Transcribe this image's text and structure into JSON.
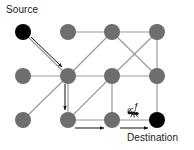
{
  "diagram": {
    "title_labels": {
      "source": "Source",
      "destination": "Destination"
    },
    "type": "grid-graph-ant-colony-routing",
    "colors": {
      "node_normal": "#6e6e6e",
      "node_endpoint": "#000000",
      "edge": "#9a9a9a",
      "arrow": "#111111",
      "background": "#ffffff",
      "text": "#1a1a1a"
    },
    "geometry": {
      "node_radius": 8,
      "columns_x": [
        23,
        68,
        112,
        157
      ],
      "rows_y": [
        32,
        76,
        120
      ]
    },
    "nodes": [
      {
        "id": "n00",
        "name": "source-node",
        "x": 23,
        "y": 32,
        "fill": "#000000",
        "role": "source"
      },
      {
        "id": "n01",
        "name": "grid-node-r0c1",
        "x": 68,
        "y": 32,
        "fill": "#6e6e6e",
        "role": "intermediate"
      },
      {
        "id": "n02",
        "name": "grid-node-r0c2",
        "x": 112,
        "y": 32,
        "fill": "#6e6e6e",
        "role": "intermediate"
      },
      {
        "id": "n03",
        "name": "grid-node-r0c3",
        "x": 157,
        "y": 32,
        "fill": "#6e6e6e",
        "role": "intermediate"
      },
      {
        "id": "n10",
        "name": "grid-node-r1c0",
        "x": 23,
        "y": 76,
        "fill": "#6e6e6e",
        "role": "intermediate"
      },
      {
        "id": "n11",
        "name": "grid-node-r1c1",
        "x": 68,
        "y": 76,
        "fill": "#6e6e6e",
        "role": "intermediate"
      },
      {
        "id": "n12",
        "name": "grid-node-r1c2",
        "x": 112,
        "y": 76,
        "fill": "#6e6e6e",
        "role": "intermediate"
      },
      {
        "id": "n13",
        "name": "grid-node-r1c3",
        "x": 157,
        "y": 76,
        "fill": "#6e6e6e",
        "role": "intermediate"
      },
      {
        "id": "n20",
        "name": "grid-node-r2c0",
        "x": 23,
        "y": 120,
        "fill": "#6e6e6e",
        "role": "intermediate"
      },
      {
        "id": "n21",
        "name": "grid-node-r2c1",
        "x": 68,
        "y": 120,
        "fill": "#6e6e6e",
        "role": "intermediate"
      },
      {
        "id": "n22",
        "name": "grid-node-r2c2",
        "x": 112,
        "y": 120,
        "fill": "#6e6e6e",
        "role": "intermediate"
      },
      {
        "id": "n23",
        "name": "destination-node",
        "x": 157,
        "y": 120,
        "fill": "#000000",
        "role": "destination"
      }
    ],
    "edges": [
      {
        "name": "edge-r0c1-r0c2",
        "x1": 68,
        "y1": 32,
        "x2": 112,
        "y2": 32
      },
      {
        "name": "edge-r0c2-r0c3",
        "x1": 112,
        "y1": 32,
        "x2": 157,
        "y2": 32
      },
      {
        "name": "edge-r1c0-r1c1",
        "x1": 23,
        "y1": 76,
        "x2": 68,
        "y2": 76
      },
      {
        "name": "edge-r1c1-r1c2",
        "x1": 68,
        "y1": 76,
        "x2": 112,
        "y2": 76
      },
      {
        "name": "edge-r1c2-r1c3",
        "x1": 112,
        "y1": 76,
        "x2": 157,
        "y2": 76
      },
      {
        "name": "edge-r2c1-r2c2",
        "x1": 68,
        "y1": 120,
        "x2": 112,
        "y2": 120
      },
      {
        "name": "edge-r2c2-r2c3",
        "x1": 112,
        "y1": 120,
        "x2": 157,
        "y2": 120
      },
      {
        "name": "edge-r0c3-r1c3",
        "x1": 157,
        "y1": 32,
        "x2": 157,
        "y2": 76
      },
      {
        "name": "edge-r1c1-r2c1",
        "x1": 68,
        "y1": 76,
        "x2": 68,
        "y2": 120
      },
      {
        "name": "edge-r1c2-r2c2",
        "x1": 112,
        "y1": 76,
        "x2": 112,
        "y2": 120
      },
      {
        "name": "edge-r1c3-r2c3",
        "x1": 157,
        "y1": 76,
        "x2": 157,
        "y2": 120
      },
      {
        "name": "edge-diag-source-r1c1",
        "x1": 23,
        "y1": 32,
        "x2": 68,
        "y2": 76
      },
      {
        "name": "edge-diag-r0c2-r1c1",
        "x1": 112,
        "y1": 32,
        "x2": 68,
        "y2": 76
      },
      {
        "name": "edge-diag-r0c2-r1c3",
        "x1": 112,
        "y1": 32,
        "x2": 157,
        "y2": 76
      },
      {
        "name": "edge-diag-r0c3-r1c2",
        "x1": 157,
        "y1": 32,
        "x2": 112,
        "y2": 76
      },
      {
        "name": "edge-diag-r1c1-r2c0",
        "x1": 68,
        "y1": 76,
        "x2": 23,
        "y2": 120
      },
      {
        "name": "edge-diag-r1c2-r2c1",
        "x1": 112,
        "y1": 76,
        "x2": 68,
        "y2": 120
      }
    ],
    "path_arrows": [
      {
        "name": "path-arrow-source-to-r1c1",
        "x1": 31,
        "y1": 37,
        "x2": 62,
        "y2": 67,
        "direction": "down-right"
      },
      {
        "name": "path-arrow-r1c1-to-r2c1",
        "x1": 65,
        "y1": 84,
        "x2": 65,
        "y2": 110,
        "direction": "down"
      },
      {
        "name": "path-arrow-r2c1-to-r2c2",
        "x1": 75,
        "y1": 128,
        "x2": 104,
        "y2": 128,
        "direction": "right"
      },
      {
        "name": "path-arrow-r2c2-to-destination",
        "x1": 120,
        "y1": 128,
        "x2": 148,
        "y2": 128,
        "direction": "right"
      }
    ],
    "ant": {
      "name": "ant-marker",
      "x": 133,
      "y": 112,
      "facing": "left",
      "description": "ant walking toward destination node"
    }
  }
}
